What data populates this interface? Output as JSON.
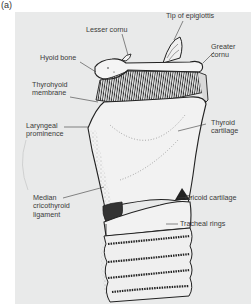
{
  "figure": {
    "panel_label": "(a)",
    "background_color": "#e9eaea",
    "line_color": "#222222",
    "text_color": "#3a3a3a"
  },
  "labels": {
    "lesser_cornu": "Lesser cornu",
    "tip_of_epiglottis": "Tip of epiglottis",
    "hyoid_bone": "Hyoid bone",
    "greater_cornu_1": "Greater",
    "greater_cornu_2": "cornu",
    "thyrohyoid_membrane_1": "Thyrohyoid",
    "thyrohyoid_membrane_2": "membrane",
    "laryngeal_prominence_1": "Laryngeal",
    "laryngeal_prominence_2": "prominence",
    "thyroid_cartilage_1": "Thyroid",
    "thyroid_cartilage_2": "cartilage",
    "median_cricothyroid_ligament_1": "Median",
    "median_cricothyroid_ligament_2": "cricothyroid",
    "median_cricothyroid_ligament_3": "ligament",
    "cricoid_cartilage": "Cricoid cartilage",
    "tracheal_rings": "Tracheal rings"
  }
}
